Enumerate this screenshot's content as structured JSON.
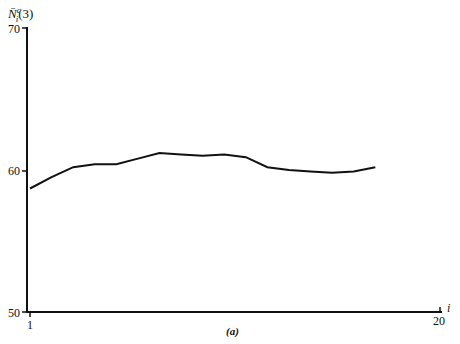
{
  "chart_data": {
    "type": "line",
    "title": "",
    "caption": "(a)",
    "xlabel": "i",
    "ylabel": "N̄ᵢᶜ(3)",
    "xlim": [
      1,
      20
    ],
    "ylim": [
      50,
      70
    ],
    "x_ticks": [
      "1",
      "20"
    ],
    "y_ticks": [
      "50",
      "60",
      "70"
    ],
    "grid": false,
    "series": [
      {
        "name": "N̄ᵢᶜ(3)",
        "x": [
          1,
          2,
          3,
          4,
          5,
          6,
          7,
          8,
          9,
          10,
          11,
          12,
          13,
          14,
          15,
          16,
          17
        ],
        "values": [
          58.7,
          59.5,
          60.2,
          60.4,
          60.4,
          60.8,
          61.2,
          61.1,
          61.0,
          61.1,
          60.9,
          60.2,
          60.0,
          59.9,
          59.8,
          59.9,
          60.2
        ]
      }
    ]
  },
  "labels": {
    "ylabel_main": "N̄",
    "ylabel_sup": "c",
    "ylabel_sub": "i",
    "ylabel_arg": "(3)",
    "y_top": "70",
    "y_mid": "60",
    "y_bottom": "50",
    "x_start": "1",
    "x_end": "20",
    "x_axis_name": "i",
    "caption": "(a)"
  }
}
